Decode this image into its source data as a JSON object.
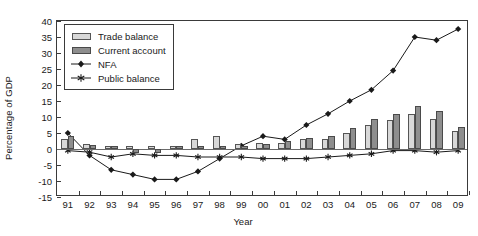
{
  "chart_data": {
    "type": "bar",
    "title": "",
    "xlabel": "Year",
    "ylabel": "Percentage of GDP",
    "categories": [
      "91",
      "92",
      "93",
      "94",
      "95",
      "96",
      "97",
      "98",
      "99",
      "00",
      "01",
      "02",
      "03",
      "04",
      "05",
      "06",
      "07",
      "08",
      "09"
    ],
    "xlim_labels": [
      "91",
      "09"
    ],
    "ylim": [
      -15,
      40
    ],
    "ytick_labels": [
      "40",
      "35",
      "30",
      "25",
      "20",
      "15",
      "10",
      "5",
      "0",
      "-5",
      "-10",
      "-15"
    ],
    "yticks": [
      40,
      35,
      30,
      25,
      20,
      15,
      10,
      5,
      0,
      -5,
      -10,
      -15
    ],
    "grid": false,
    "legend_position": "top-left",
    "legend": [
      "Trade balance",
      "Current account",
      "NFA",
      "Public balance"
    ],
    "series": [
      {
        "name": "Trade balance",
        "kind": "bar",
        "color": "#d8d8d8",
        "values": [
          3.0,
          1.5,
          1.0,
          0.8,
          0.8,
          1.0,
          3.0,
          4.0,
          1.5,
          2.0,
          2.0,
          3.0,
          3.0,
          5.0,
          7.5,
          9.0,
          11.0,
          9.5,
          5.5
        ]
      },
      {
        "name": "Current account",
        "kind": "bar",
        "color": "#8e8e8e",
        "values": [
          4.0,
          1.2,
          1.0,
          -1.2,
          -1.3,
          0.8,
          1.0,
          1.0,
          0.8,
          1.5,
          2.5,
          3.5,
          4.0,
          6.5,
          9.5,
          11.0,
          13.5,
          12.0,
          7.0
        ]
      },
      {
        "name": "NFA",
        "kind": "line",
        "marker": "diamond",
        "color": "#1a1a1a",
        "values": [
          5.0,
          -2.0,
          -6.5,
          -8.0,
          -9.5,
          -9.5,
          -7.0,
          -3.0,
          1.0,
          4.0,
          3.0,
          7.5,
          11.0,
          15.0,
          18.5,
          24.5,
          35.0,
          34.0,
          37.5
        ]
      },
      {
        "name": "Public balance",
        "kind": "line",
        "marker": "asterisk",
        "color": "#1a1a1a",
        "values": [
          -0.5,
          -1.0,
          -2.5,
          -1.5,
          -2.0,
          -2.0,
          -2.5,
          -2.5,
          -2.5,
          -3.0,
          -3.0,
          -3.0,
          -2.5,
          -2.0,
          -1.5,
          -0.5,
          -0.5,
          -1.0,
          -0.5
        ]
      }
    ]
  }
}
